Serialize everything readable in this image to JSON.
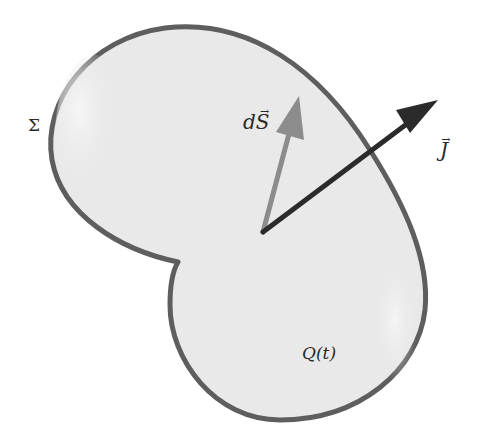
{
  "figure": {
    "colors": {
      "background": "#ffffff",
      "region_fill": "#e9e9e9",
      "region_highlight": "#f4f4f4",
      "boundary_stroke": "#5e5e5e",
      "dS_arrow": "#8c8c8c",
      "J_arrow": "#2b2b2b",
      "text": "#2a2a2a"
    },
    "labels": {
      "surface": "Σ",
      "area_element_prefix": "d",
      "area_element_symbol": "S",
      "area_element_vec": "→",
      "current_density_symbol": "J",
      "current_density_vec": "→",
      "enclosed_charge": "Q(t)"
    },
    "vectors": {
      "dS": {
        "from": [
          263,
          232
        ],
        "to": [
          299,
          97
        ],
        "color": "#8c8c8c"
      },
      "J": {
        "from": [
          263,
          232
        ],
        "to": [
          438,
          100
        ],
        "color": "#2b2b2b"
      }
    }
  }
}
